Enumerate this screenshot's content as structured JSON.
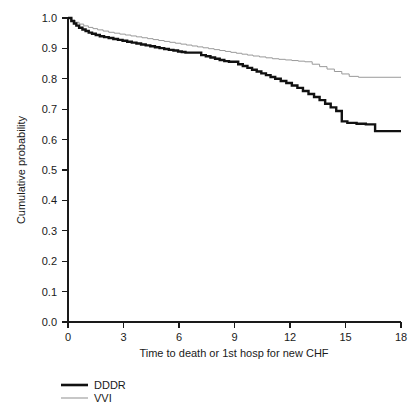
{
  "chart_data": {
    "type": "line",
    "title": "",
    "subtitle": "",
    "xlabel": "Time to death or 1st hosp for new CHF",
    "ylabel": "Cumulative probability",
    "xlim": [
      0,
      18
    ],
    "ylim": [
      0.0,
      1.0
    ],
    "xticks": [
      0,
      3,
      6,
      9,
      12,
      15,
      18
    ],
    "xtick_labels": [
      "0",
      "3",
      "6",
      "9",
      "12",
      "15",
      "18"
    ],
    "yticks": [
      0.0,
      0.1,
      0.2,
      0.3,
      0.4,
      0.5,
      0.6,
      0.7,
      0.8,
      0.9,
      1.0
    ],
    "ytick_labels": [
      "0.0",
      "0.1",
      "0.2",
      "0.3",
      "0.4",
      "0.5",
      "0.6",
      "0.7",
      "0.8",
      "0.9",
      "1.0"
    ],
    "grid": false,
    "legend_position": "below-left",
    "step_style": "post",
    "series": [
      {
        "name": "DDDR",
        "color": "#111111",
        "line_width": 2.4,
        "x": [
          0,
          0.18,
          0.32,
          0.45,
          0.6,
          0.78,
          0.95,
          1.12,
          1.3,
          1.5,
          1.72,
          1.95,
          2.2,
          2.45,
          2.7,
          2.95,
          3.2,
          3.45,
          3.7,
          3.95,
          4.2,
          4.45,
          4.7,
          4.95,
          5.2,
          5.45,
          5.7,
          5.95,
          6.15,
          6.35,
          6.6,
          6.9,
          7.2,
          7.45,
          7.7,
          7.95,
          8.2,
          8.45,
          8.7,
          8.95,
          9.2,
          9.45,
          9.7,
          9.95,
          10.2,
          10.45,
          10.7,
          10.95,
          11.2,
          11.5,
          11.8,
          12.1,
          12.4,
          12.7,
          13.0,
          13.3,
          13.6,
          13.9,
          14.2,
          14.5,
          14.8,
          15.1,
          15.6,
          16.1,
          16.6,
          18.0
        ],
        "y": [
          1.0,
          0.99,
          0.982,
          0.975,
          0.968,
          0.962,
          0.957,
          0.952,
          0.948,
          0.944,
          0.94,
          0.937,
          0.934,
          0.931,
          0.928,
          0.925,
          0.922,
          0.919,
          0.916,
          0.913,
          0.91,
          0.907,
          0.904,
          0.901,
          0.898,
          0.895,
          0.893,
          0.89,
          0.888,
          0.886,
          0.886,
          0.886,
          0.878,
          0.874,
          0.87,
          0.866,
          0.862,
          0.858,
          0.856,
          0.856,
          0.848,
          0.842,
          0.836,
          0.83,
          0.824,
          0.818,
          0.812,
          0.806,
          0.8,
          0.793,
          0.786,
          0.778,
          0.77,
          0.76,
          0.75,
          0.74,
          0.73,
          0.718,
          0.706,
          0.694,
          0.66,
          0.655,
          0.652,
          0.65,
          0.628,
          0.628
        ]
      },
      {
        "name": "VVI",
        "color": "#9a9a9a",
        "line_width": 1.0,
        "x": [
          0,
          0.2,
          0.4,
          0.6,
          0.85,
          1.1,
          1.35,
          1.6,
          1.9,
          2.2,
          2.5,
          2.8,
          3.1,
          3.4,
          3.7,
          4.0,
          4.3,
          4.6,
          4.9,
          5.2,
          5.5,
          5.8,
          6.1,
          6.4,
          6.7,
          7.0,
          7.3,
          7.6,
          7.9,
          8.2,
          8.5,
          8.8,
          9.1,
          9.4,
          9.7,
          10.0,
          10.35,
          10.7,
          11.05,
          11.4,
          11.75,
          12.1,
          12.45,
          12.8,
          13.2,
          13.6,
          14.0,
          14.4,
          14.8,
          15.2,
          15.7,
          18.0
        ],
        "y": [
          1.0,
          0.992,
          0.986,
          0.98,
          0.974,
          0.969,
          0.965,
          0.961,
          0.957,
          0.953,
          0.95,
          0.947,
          0.944,
          0.941,
          0.938,
          0.935,
          0.932,
          0.929,
          0.926,
          0.923,
          0.92,
          0.917,
          0.914,
          0.911,
          0.908,
          0.905,
          0.902,
          0.899,
          0.896,
          0.893,
          0.89,
          0.887,
          0.884,
          0.881,
          0.878,
          0.875,
          0.872,
          0.869,
          0.866,
          0.864,
          0.862,
          0.86,
          0.858,
          0.856,
          0.848,
          0.84,
          0.832,
          0.824,
          0.816,
          0.808,
          0.805,
          0.805
        ]
      }
    ]
  },
  "axes": {
    "y_title": "Cumulative probability",
    "x_title": "Time to death or 1st hosp for new CHF"
  },
  "legend": {
    "items": [
      {
        "label": "DDDR"
      },
      {
        "label": "VVI"
      }
    ]
  }
}
